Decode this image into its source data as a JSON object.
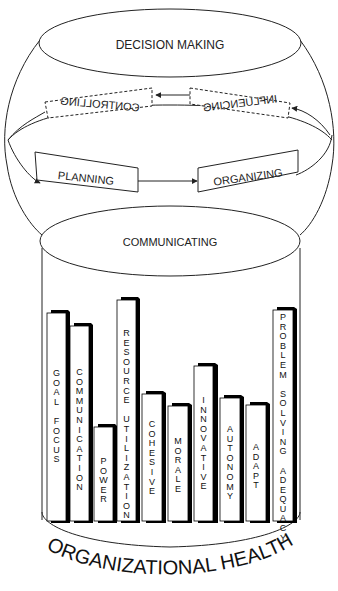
{
  "diagram": {
    "top_ellipse_label": "DECISION MAKING",
    "cycle": {
      "controlling": "CONTROLLING",
      "influencing": "INFLUENCING",
      "planning": "PLANNING",
      "organizing": "ORGANIZING"
    },
    "bottom_ellipse_label": "COMMUNICATING",
    "base_label": "ORGANIZATIONAL HEALTH",
    "colors": {
      "ink": "#222222",
      "bar_shadow": "#000000",
      "bar_face": "#ffffff"
    }
  },
  "chart_data": {
    "type": "bar",
    "title": "ORGANIZATIONAL HEALTH",
    "categories": [
      "GOAL FOCUS",
      "COMMUNICATION",
      "POWER",
      "RESOURCE UTILIZATION",
      "COHESIVE",
      "MORALE",
      "INNOVATIVE",
      "AUTONOMY",
      "ADAPT",
      "PROBLEM SOLVING ADEQUACY"
    ],
    "values": [
      208,
      195,
      94,
      221,
      127,
      115,
      155,
      123,
      116,
      211
    ],
    "xlabel": "",
    "ylabel": "",
    "note": "Values are relative bar heights in pixels (no axis shown)"
  },
  "bars": [
    {
      "label": "GOAL FOCUS",
      "x": 47,
      "top": 312
    },
    {
      "label": "COMMUNICATION",
      "x": 70,
      "top": 325
    },
    {
      "label": "POWER",
      "x": 94,
      "top": 426
    },
    {
      "label": "RESOURCE UTILIZATION",
      "x": 117,
      "top": 299
    },
    {
      "label": "COHESIVE",
      "x": 142,
      "top": 393
    },
    {
      "label": "MORALE",
      "x": 168,
      "top": 405
    },
    {
      "label": "INNOVATIVE",
      "x": 194,
      "top": 365
    },
    {
      "label": "AUTONOMY",
      "x": 220,
      "top": 397
    },
    {
      "label": "ADAPT",
      "x": 246,
      "top": 404
    },
    {
      "label": "PROBLEM SOLVING ADEQUACY",
      "x": 273,
      "top": 309
    }
  ]
}
